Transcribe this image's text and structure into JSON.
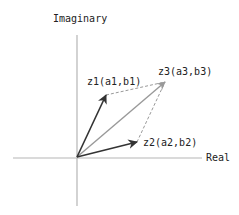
{
  "diagram": {
    "axes": {
      "horizontal_label": "Real",
      "vertical_label": "Imaginary"
    },
    "vectors": [
      {
        "id": "z1",
        "label": "z1(a1,b1)"
      },
      {
        "id": "z2",
        "label": "z2(a2,b2)"
      },
      {
        "id": "z3",
        "label": "z3(a3,b3)"
      }
    ],
    "colors": {
      "axis": "#b5b5b5",
      "vector_dark": "#333333",
      "vector_sum": "#999999",
      "dashed": "#999999",
      "text": "#222222"
    }
  }
}
